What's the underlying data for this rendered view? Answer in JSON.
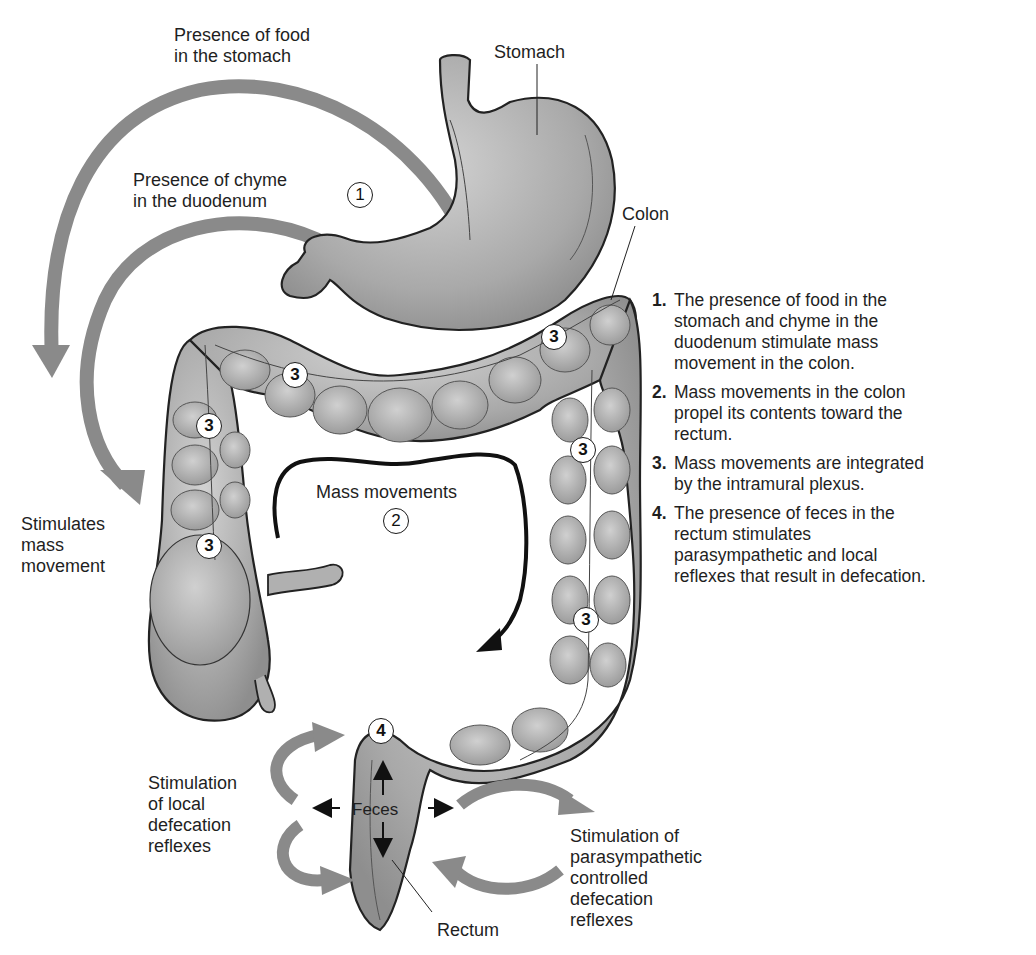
{
  "figure": {
    "labels": {
      "food_stomach": [
        "Presence of food",
        "in the stomach"
      ],
      "stomach": "Stomach",
      "chyme_duodenum": [
        "Presence of chyme",
        "in the duodenum"
      ],
      "colon": "Colon",
      "stimulates_mass": [
        "Stimulates",
        "mass",
        "movement"
      ],
      "mass_movements": "Mass movements",
      "local_reflexes": [
        "Stimulation",
        "of local",
        "defecation",
        "reflexes"
      ],
      "feces": "Feces",
      "rectum": "Rectum",
      "parasympathetic": [
        "Stimulation of",
        "parasympathetic",
        "controlled",
        "defecation",
        "reflexes"
      ]
    },
    "markers": {
      "m1": "1",
      "m2": "2",
      "m3a": "3",
      "m3b": "3",
      "m3c": "3",
      "m3d": "3",
      "m3e": "3",
      "m3f": "3",
      "m4": "4"
    },
    "colors": {
      "organ_fill": "#b4b4b4",
      "organ_stroke": "#222222",
      "arrow_gray": "#8a8a8a",
      "arrow_black": "#111111"
    }
  },
  "steps": [
    {
      "num": "1.",
      "lines": [
        "The presence of food in the",
        "stomach and chyme in the",
        "duodenum stimulate mass",
        "movement in the colon."
      ]
    },
    {
      "num": "2.",
      "lines": [
        "Mass movements in the colon",
        "propel its contents toward the",
        "rectum."
      ]
    },
    {
      "num": "3.",
      "lines": [
        "Mass movements are integrated",
        "by the intramural plexus."
      ]
    },
    {
      "num": "4.",
      "lines": [
        "The presence of feces in the",
        "rectum stimulates",
        "parasympathetic and local",
        "reflexes that result in defecation."
      ]
    }
  ]
}
